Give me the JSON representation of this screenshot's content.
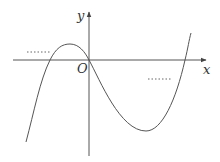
{
  "diagram": {
    "type": "function-graph",
    "axes": {
      "x_label": "x",
      "y_label": "y",
      "origin_label": "O"
    },
    "annotations": {
      "left_dots": "……",
      "right_dots": "……"
    },
    "colors": {
      "curve": "#555555",
      "axes": "#555555",
      "text": "#333333",
      "dots": "#666666"
    }
  }
}
